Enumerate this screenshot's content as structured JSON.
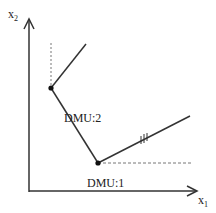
{
  "diagram": {
    "axes": {
      "y_label": "x",
      "y_sub": "2",
      "x_label": "x",
      "x_sub": "1"
    },
    "points": [
      {
        "label": "DMU:2",
        "x": 51,
        "y": 88
      },
      {
        "label": "DMU:1",
        "x": 98,
        "y": 163
      }
    ],
    "frontier_label": "",
    "colors": {
      "line": "#333333",
      "dashed": "#777777",
      "point": "#111111"
    }
  }
}
